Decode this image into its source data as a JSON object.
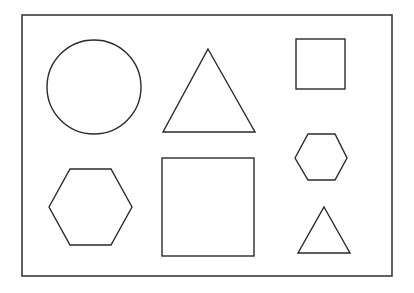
{
  "canvas": {
    "width": 414,
    "height": 293,
    "background": "#ffffff",
    "stroke": "#2b2b2b"
  },
  "frame": {
    "x": 22,
    "y": 15,
    "width": 370,
    "height": 261
  },
  "shapes": [
    {
      "type": "circle",
      "name": "large-circle",
      "cx": 94,
      "cy": 87,
      "r": 47
    },
    {
      "type": "triangle",
      "name": "large-triangle",
      "points": "208,49 255,132 163,132"
    },
    {
      "type": "square",
      "name": "small-square",
      "x": 296,
      "y": 39,
      "width": 49,
      "height": 50
    },
    {
      "type": "hexagon",
      "name": "large-hexagon",
      "points": "49,207 70,169 111,169 132,207 111,245 70,245"
    },
    {
      "type": "square",
      "name": "large-square",
      "x": 162,
      "y": 158,
      "width": 92,
      "height": 98
    },
    {
      "type": "hexagon",
      "name": "small-hexagon",
      "points": "295,158 308,134 335,134 347,158 335,180 308,180"
    },
    {
      "type": "triangle",
      "name": "small-triangle",
      "points": "324,207 350,253 298,253"
    }
  ]
}
